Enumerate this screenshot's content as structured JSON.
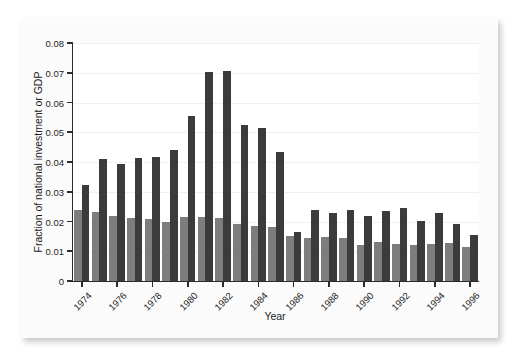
{
  "chart_data": {
    "type": "bar",
    "title": "",
    "xlabel": "Year",
    "ylabel": "Fraction of national investment or GDP",
    "ylim": [
      0,
      0.08
    ],
    "ytick_labels": [
      "0",
      "0.01",
      "0.02",
      "0.03",
      "0.04",
      "0.05",
      "0.06",
      "0.07",
      "0.08"
    ],
    "ytick_values": [
      0,
      0.01,
      0.02,
      0.03,
      0.04,
      0.05,
      0.06,
      0.07,
      0.08
    ],
    "xtick_labels": [
      "1974",
      "1976",
      "1978",
      "1980",
      "1982",
      "1984",
      "1986",
      "1988",
      "1990",
      "1992",
      "1994",
      "1996"
    ],
    "xtick_values": [
      1974,
      1976,
      1978,
      1980,
      1982,
      1984,
      1986,
      1988,
      1990,
      1992,
      1994,
      1996
    ],
    "categories": [
      1974,
      1975,
      1976,
      1977,
      1978,
      1979,
      1980,
      1981,
      1982,
      1983,
      1984,
      1985,
      1986,
      1987,
      1988,
      1989,
      1990,
      1991,
      1992,
      1993,
      1994,
      1995,
      1996
    ],
    "grid": "horizontal",
    "legend": "none",
    "series": [
      {
        "name": "Fraction of national investment",
        "color": "#7d7d7d",
        "values": [
          0.024,
          0.0233,
          0.0217,
          0.0213,
          0.0209,
          0.02,
          0.0214,
          0.0215,
          0.0212,
          0.0193,
          0.0186,
          0.018,
          0.0151,
          0.0145,
          0.0148,
          0.0144,
          0.0121,
          0.013,
          0.0125,
          0.012,
          0.0124,
          0.0127,
          0.0114
        ]
      },
      {
        "name": "Fraction of GDP",
        "color": "#3b3b3b",
        "values": [
          0.0322,
          0.0409,
          0.0392,
          0.0414,
          0.0418,
          0.0442,
          0.0553,
          0.0702,
          0.0707,
          0.0525,
          0.0516,
          0.0434,
          0.0165,
          0.0238,
          0.023,
          0.024,
          0.0218,
          0.0235,
          0.0246,
          0.0201,
          0.0228,
          0.0192,
          0.0155
        ]
      }
    ]
  },
  "axis_titles": {
    "y": "Fraction of national investment or GDP",
    "x": "Year"
  }
}
